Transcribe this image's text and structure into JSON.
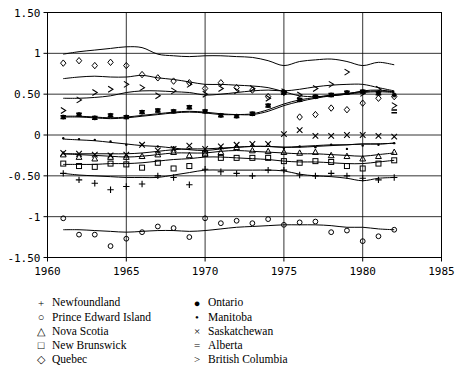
{
  "chart_data": {
    "type": "scatter",
    "title": "",
    "xlabel": "",
    "ylabel": "",
    "xlim": [
      1960,
      1985
    ],
    "ylim": [
      -1.5,
      1.5
    ],
    "xticks": [
      1960,
      1965,
      1970,
      1975,
      1980,
      1985
    ],
    "xtick_labels": [
      "1960",
      "1965",
      "1970",
      "1975",
      "1980",
      "1985"
    ],
    "yticks": [
      1.5,
      1.0,
      0.5,
      0.0,
      -0.5,
      -1.0,
      -1.5
    ],
    "ytick_labels": [
      "1.50",
      "1",
      "0.50",
      "0",
      "-0.50",
      "-1",
      "-1.50"
    ],
    "grid": true,
    "legend_position": "below",
    "x": [
      1961,
      1962,
      1963,
      1964,
      1965,
      1966,
      1967,
      1968,
      1969,
      1970,
      1971,
      1972,
      1973,
      1974,
      1975,
      1976,
      1977,
      1978,
      1979,
      1980,
      1981,
      1982
    ],
    "series": [
      {
        "name": "Newfoundland",
        "marker": "+",
        "values": [
          -0.47,
          -0.55,
          -0.59,
          -0.67,
          -0.63,
          -0.6,
          -0.5,
          -0.52,
          -0.61,
          -0.42,
          -0.45,
          -0.47,
          -0.5,
          -0.43,
          -0.43,
          -0.49,
          -0.5,
          -0.47,
          -0.5,
          -0.53,
          -0.55,
          -0.52
        ],
        "fit": [
          -0.47,
          -0.49,
          -0.5,
          -0.51,
          -0.52,
          -0.52,
          -0.52,
          -0.49,
          -0.46,
          -0.43,
          -0.43,
          -0.43,
          -0.43,
          -0.43,
          -0.44,
          -0.48,
          -0.5,
          -0.51,
          -0.53,
          -0.56,
          -0.53,
          -0.52
        ]
      },
      {
        "name": "Prince Edward Island",
        "marker": "o",
        "values": [
          -1.02,
          -1.22,
          -1.22,
          -1.36,
          -1.27,
          -1.19,
          -1.12,
          -1.14,
          -1.25,
          -1.02,
          -1.08,
          -1.05,
          -1.08,
          -1.03,
          -1.1,
          -1.07,
          -1.06,
          -1.19,
          -1.17,
          -1.3,
          -1.24,
          -1.16
        ],
        "fit": [
          -1.16,
          -1.16,
          -1.17,
          -1.18,
          -1.19,
          -1.18,
          -1.17,
          -1.17,
          -1.18,
          -1.17,
          -1.15,
          -1.13,
          -1.12,
          -1.11,
          -1.1,
          -1.1,
          -1.1,
          -1.11,
          -1.13,
          -1.13,
          -1.15,
          -1.16
        ]
      },
      {
        "name": "Nova Scotia",
        "marker": "triangle",
        "values": [
          -0.24,
          -0.27,
          -0.29,
          -0.27,
          -0.27,
          -0.26,
          -0.24,
          -0.21,
          -0.25,
          -0.23,
          -0.21,
          -0.15,
          -0.19,
          -0.2,
          -0.21,
          -0.22,
          -0.21,
          -0.25,
          -0.26,
          -0.29,
          -0.26,
          -0.21
        ],
        "fit": [
          -0.23,
          -0.24,
          -0.25,
          -0.26,
          -0.27,
          -0.26,
          -0.24,
          -0.22,
          -0.22,
          -0.22,
          -0.2,
          -0.19,
          -0.2,
          -0.21,
          -0.22,
          -0.23,
          -0.23,
          -0.24,
          -0.25,
          -0.26,
          -0.24,
          -0.22
        ]
      },
      {
        "name": "New Brunswick",
        "marker": "square",
        "values": [
          -0.35,
          -0.38,
          -0.39,
          -0.35,
          -0.36,
          -0.4,
          -0.34,
          -0.41,
          -0.38,
          -0.23,
          -0.28,
          -0.28,
          -0.28,
          -0.28,
          -0.32,
          -0.34,
          -0.32,
          -0.33,
          -0.38,
          -0.41,
          -0.35,
          -0.31
        ],
        "fit": [
          -0.36,
          -0.36,
          -0.36,
          -0.35,
          -0.35,
          -0.34,
          -0.32,
          -0.3,
          -0.29,
          -0.27,
          -0.27,
          -0.28,
          -0.29,
          -0.3,
          -0.32,
          -0.33,
          -0.33,
          -0.34,
          -0.35,
          -0.35,
          -0.33,
          -0.31
        ]
      },
      {
        "name": "Quebec",
        "marker": "diamond",
        "values": [
          0.88,
          0.91,
          0.85,
          0.89,
          0.85,
          0.74,
          0.7,
          0.66,
          0.64,
          0.57,
          0.64,
          0.58,
          0.55,
          0.47,
          0.52,
          0.22,
          0.25,
          0.33,
          0.31,
          0.39,
          0.45,
          0.47
        ],
        "fit": [
          0.69,
          0.71,
          0.72,
          0.71,
          0.71,
          0.73,
          0.7,
          0.68,
          0.65,
          0.62,
          0.62,
          0.61,
          0.6,
          0.58,
          0.53,
          0.48,
          0.47,
          0.48,
          0.5,
          0.54,
          0.55,
          0.53
        ]
      },
      {
        "name": "Ontario",
        "marker": "filled-circle",
        "values": [
          0.22,
          0.25,
          0.21,
          0.24,
          0.22,
          0.28,
          0.3,
          0.29,
          0.34,
          0.29,
          0.24,
          0.23,
          0.26,
          0.36,
          0.52,
          0.43,
          0.47,
          0.49,
          0.52,
          0.53,
          0.51,
          0.49
        ],
        "fit": [
          0.23,
          0.23,
          0.22,
          0.21,
          0.22,
          0.24,
          0.26,
          0.28,
          0.29,
          0.28,
          0.26,
          0.25,
          0.25,
          0.29,
          0.36,
          0.41,
          0.45,
          0.48,
          0.5,
          0.52,
          0.53,
          0.52
        ]
      },
      {
        "name": "Manitoba",
        "marker": "small-dot",
        "values": [
          -0.04,
          -0.05,
          -0.06,
          -0.08,
          -0.12,
          -0.12,
          -0.14,
          -0.15,
          -0.17,
          -0.19,
          -0.16,
          -0.13,
          -0.12,
          -0.11,
          -0.16,
          -0.14,
          -0.15,
          -0.12,
          -0.17,
          -0.13,
          -0.12,
          -0.1
        ],
        "fit": [
          -0.05,
          -0.06,
          -0.07,
          -0.09,
          -0.11,
          -0.13,
          -0.14,
          -0.16,
          -0.18,
          -0.19,
          -0.17,
          -0.15,
          -0.14,
          -0.14,
          -0.15,
          -0.14,
          -0.13,
          -0.12,
          -0.12,
          -0.11,
          -0.11,
          -0.1
        ]
      },
      {
        "name": "Saskatchewan",
        "marker": "x",
        "values": [
          -0.22,
          -0.23,
          -0.24,
          -0.25,
          -0.24,
          -0.12,
          -0.19,
          -0.17,
          -0.13,
          -0.17,
          -0.14,
          -0.12,
          -0.11,
          -0.11,
          0.01,
          0.06,
          -0.01,
          -0.01,
          0.0,
          0.0,
          -0.01,
          -0.02
        ],
        "fit": [
          -0.23,
          -0.23,
          -0.23,
          -0.23,
          -0.23,
          -0.22,
          -0.2,
          -0.18,
          -0.17,
          -0.17,
          -0.16,
          -0.15,
          -0.14,
          -0.14,
          -0.15,
          -0.15,
          -0.14,
          -0.13,
          -0.12,
          -0.11,
          -0.11,
          -0.1
        ]
      },
      {
        "name": "Alberta",
        "marker": "equals",
        "values": [
          0.22,
          0.25,
          0.21,
          0.24,
          0.22,
          0.28,
          0.3,
          0.29,
          0.34,
          0.29,
          0.24,
          0.23,
          0.26,
          0.36,
          0.52,
          0.43,
          0.47,
          0.49,
          0.52,
          0.53,
          0.51,
          0.29
        ],
        "fit": [
          0.22,
          0.22,
          0.21,
          0.2,
          0.21,
          0.23,
          0.25,
          0.27,
          0.28,
          0.27,
          0.25,
          0.25,
          0.26,
          0.31,
          0.38,
          0.43,
          0.46,
          0.49,
          0.51,
          0.53,
          0.54,
          0.53
        ]
      },
      {
        "name": "British Columbia",
        "marker": "gt",
        "values": [
          0.3,
          0.43,
          0.52,
          0.56,
          0.62,
          0.58,
          0.48,
          0.54,
          0.62,
          0.5,
          0.57,
          0.54,
          0.57,
          0.45,
          0.53,
          0.49,
          0.57,
          0.62,
          0.77,
          0.51,
          0.56,
          0.36
        ],
        "fit": [
          0.45,
          0.45,
          0.46,
          0.48,
          0.52,
          0.54,
          0.54,
          0.53,
          0.52,
          0.49,
          0.5,
          0.52,
          0.54,
          0.55,
          0.54,
          0.56,
          0.59,
          0.61,
          0.62,
          0.62,
          0.58,
          0.54
        ]
      },
      {
        "name": "Newfoundland-upper",
        "marker": "small-dot",
        "values": [
          0.99,
          1.02,
          1.04,
          1.06,
          1.08,
          1.07,
          0.99,
          0.97,
          0.96,
          0.97,
          0.97,
          0.96,
          0.95,
          0.91,
          0.85,
          0.9,
          0.92,
          0.93,
          0.9,
          0.85,
          0.89,
          0.86
        ],
        "fit": [
          0.99,
          1.02,
          1.04,
          1.06,
          1.08,
          1.07,
          0.99,
          0.97,
          0.96,
          0.97,
          0.97,
          0.96,
          0.95,
          0.91,
          0.85,
          0.9,
          0.92,
          0.93,
          0.9,
          0.85,
          0.89,
          0.86
        ]
      }
    ],
    "legend": [
      {
        "marker": "+",
        "label": "Newfoundland"
      },
      {
        "marker": "○",
        "label": "Prince Edward Island"
      },
      {
        "marker": "△",
        "label": "Nova Scotia"
      },
      {
        "marker": "□",
        "label": "New Brunswick"
      },
      {
        "marker": "◇",
        "label": "Quebec"
      },
      {
        "marker": "●",
        "label": "Ontario"
      },
      {
        "marker": "•",
        "label": "Manitoba"
      },
      {
        "marker": "×",
        "label": "Saskatchewan"
      },
      {
        "marker": "=",
        "label": "Alberta"
      },
      {
        "marker": ">",
        "label": "British Columbia"
      }
    ],
    "colors": {
      "line": "#000000",
      "marker": "#000000",
      "grid": "#000000",
      "axis": "#000000",
      "background": "#ffffff"
    }
  }
}
